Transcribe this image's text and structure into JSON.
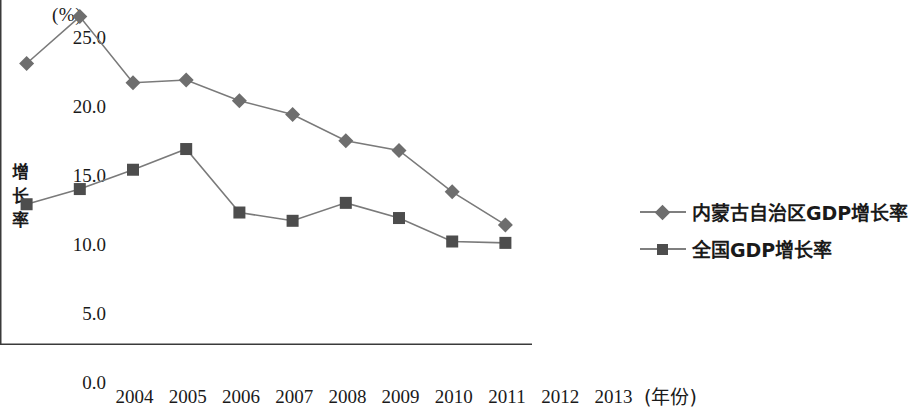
{
  "chart_data": {
    "type": "line",
    "title": "",
    "unit_label": "(%)",
    "xlabel": "(年份)",
    "ylabel": "增长率",
    "categories": [
      "2004",
      "2005",
      "2006",
      "2007",
      "2008",
      "2009",
      "2010",
      "2011",
      "2012",
      "2013"
    ],
    "ytick_labels": [
      "0.0",
      "5.0",
      "10.0",
      "15.0",
      "20.0",
      "25.0"
    ],
    "ytick_values": [
      0,
      5,
      10,
      15,
      20,
      25
    ],
    "ylim": [
      0,
      25
    ],
    "grid": false,
    "legend_position": "right",
    "series": [
      {
        "name": "内蒙古自治区GDP增长率",
        "marker": "diamond",
        "color": "#6e6e6e",
        "values": [
          20.4,
          23.8,
          19.0,
          19.2,
          17.7,
          16.7,
          14.8,
          14.1,
          11.1,
          8.7
        ]
      },
      {
        "name": "全国GDP增长率",
        "marker": "square",
        "color": "#4d4d4d",
        "values": [
          10.2,
          11.3,
          12.7,
          14.2,
          9.6,
          9.0,
          10.3,
          9.2,
          7.5,
          7.4
        ]
      }
    ]
  },
  "axis": {
    "line_color": "#3a3a3a"
  },
  "legend": {
    "items": [
      {
        "label": "内蒙古自治区GDP增长率",
        "marker": "diamond"
      },
      {
        "label": "全国GDP增长率",
        "marker": "square"
      }
    ]
  }
}
